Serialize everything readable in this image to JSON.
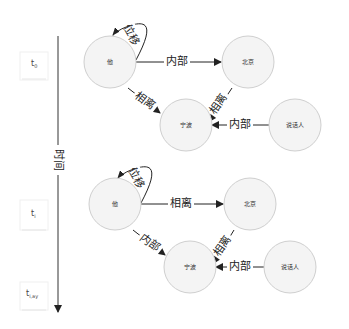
{
  "timeline": {
    "axis_label": "时间",
    "ticks": [
      {
        "label": "t",
        "sub": "0"
      },
      {
        "label": "t",
        "sub": "i"
      },
      {
        "label": "t",
        "sub": "i,ay"
      }
    ]
  },
  "panels": [
    {
      "nodes": {
        "he": "他",
        "beijing": "北京",
        "ningbo": "宁波",
        "speaker": "说话人"
      },
      "edges": {
        "self_loop": "位移",
        "he_beijing": "内部",
        "he_ningbo": "相离",
        "beijing_ningbo": "相离",
        "speaker_ningbo": "内部"
      }
    },
    {
      "nodes": {
        "he": "他",
        "beijing": "北京",
        "ningbo": "宁波",
        "speaker": "说话人"
      },
      "edges": {
        "self_loop": "位移",
        "he_beijing": "相离",
        "he_ningbo": "内部",
        "beijing_ningbo": "相离",
        "speaker_ningbo": "内部"
      }
    }
  ]
}
